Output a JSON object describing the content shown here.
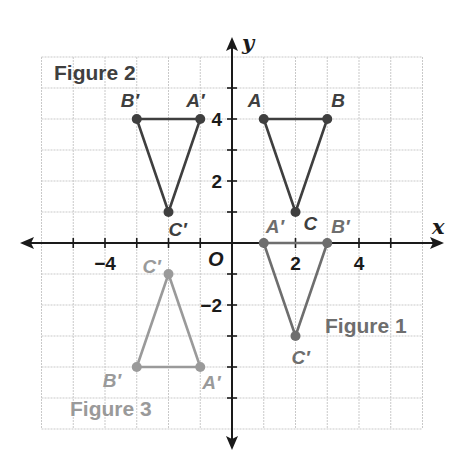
{
  "diagram": {
    "type": "coordinate-plane-transformations",
    "axes": {
      "x_label": "x",
      "y_label": "y",
      "origin_label": "O",
      "x_range": [
        -6,
        6
      ],
      "y_range": [
        -6,
        6
      ],
      "x_tick_labels": [
        {
          "value": -4,
          "text": "−4"
        },
        {
          "value": 2,
          "text": "2"
        },
        {
          "value": 4,
          "text": "4"
        }
      ],
      "y_tick_labels": [
        {
          "value": 4,
          "text": "4"
        },
        {
          "value": 2,
          "text": "2"
        },
        {
          "value": -2,
          "text": "−2"
        }
      ],
      "grid": true
    },
    "figures": [
      {
        "id": "original",
        "title": "",
        "color": "#3f3f3f",
        "vertices": [
          {
            "name": "A",
            "x": 1,
            "y": 4,
            "label_dx": -16,
            "label_dy": -12
          },
          {
            "name": "B",
            "x": 3,
            "y": 4,
            "label_dx": 4,
            "label_dy": -12
          },
          {
            "name": "C",
            "x": 2,
            "y": 1,
            "label_dx": 8,
            "label_dy": 18
          }
        ]
      },
      {
        "id": "figure-1",
        "title": "Figure 1",
        "title_pos": {
          "x": 325,
          "y": 333
        },
        "color": "#6e6e6e",
        "vertices": [
          {
            "name": "A′",
            "x": 1,
            "y": 0,
            "label_dx": 2,
            "label_dy": -10
          },
          {
            "name": "B′",
            "x": 3,
            "y": 0,
            "label_dx": 4,
            "label_dy": -10
          },
          {
            "name": "C′",
            "x": 2,
            "y": -3,
            "label_dx": -4,
            "label_dy": 28
          }
        ]
      },
      {
        "id": "figure-2",
        "title": "Figure 2",
        "title_pos": {
          "x": 54,
          "y": 80
        },
        "color": "#3f3f3f",
        "vertices": [
          {
            "name": "A′",
            "x": -1,
            "y": 4,
            "label_dx": -14,
            "label_dy": -12
          },
          {
            "name": "B′",
            "x": -3,
            "y": 4,
            "label_dx": -16,
            "label_dy": -12
          },
          {
            "name": "C′",
            "x": -2,
            "y": 1,
            "label_dx": 0,
            "label_dy": 24
          }
        ]
      },
      {
        "id": "figure-3",
        "title": "Figure 3",
        "title_pos": {
          "x": 70,
          "y": 416
        },
        "color": "#9a9a9a",
        "vertices": [
          {
            "name": "A′",
            "x": -1,
            "y": -4,
            "label_dx": 2,
            "label_dy": 22
          },
          {
            "name": "B′",
            "x": -3,
            "y": -4,
            "label_dx": -34,
            "label_dy": 20
          },
          {
            "name": "C′",
            "x": -2,
            "y": -1,
            "label_dx": -26,
            "label_dy": -1
          }
        ]
      }
    ]
  }
}
